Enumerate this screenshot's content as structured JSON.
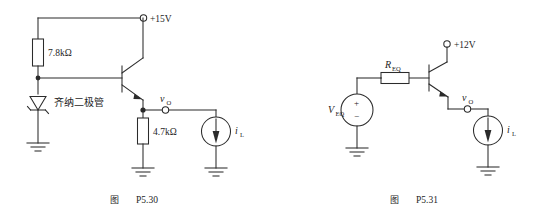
{
  "page": {
    "background_color": "#ffffff",
    "line_color": "#2b2b2b"
  },
  "figures": [
    {
      "id": "p5-30",
      "caption_prefix": "图",
      "caption_number": "P5.30",
      "labels": {
        "supply": "+15V",
        "resistor_bias": "7.8kΩ",
        "zener": "齐纳二极管",
        "resistor_load": "4.7kΩ",
        "output_node": "v",
        "output_node_sub": "O",
        "current_source": "i",
        "current_source_sub": "L"
      }
    },
    {
      "id": "p5-31",
      "caption_prefix": "图",
      "caption_number": "P5.31",
      "labels": {
        "supply": "+12V",
        "resistor_eq": "R",
        "resistor_eq_sub": "EQ",
        "source_eq": "V",
        "source_eq_sub": "EQ",
        "source_plus": "+",
        "source_minus": "−",
        "output_node": "v",
        "output_node_sub": "O",
        "current_source": "i",
        "current_source_sub": "L"
      }
    }
  ]
}
